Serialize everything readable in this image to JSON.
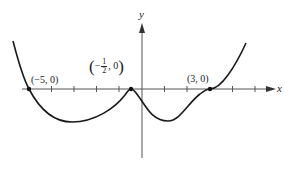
{
  "diagram": {
    "type": "polynomial-graph",
    "axes": {
      "x_label": "x",
      "y_label": "y"
    },
    "points": [
      {
        "id": "p1",
        "label": "(−5, 0)",
        "x": -5,
        "y": 0
      },
      {
        "id": "p2",
        "label_prefix": "−",
        "label_num": "1",
        "label_den": "2",
        "label_suffix": ", 0",
        "x": -0.5,
        "y": 0
      },
      {
        "id": "p3",
        "label": "(3, 0)",
        "x": 3,
        "y": 0
      }
    ],
    "colors": {
      "curve": "#1a1a1a",
      "axis": "#444444",
      "background": "#ffffff"
    }
  }
}
